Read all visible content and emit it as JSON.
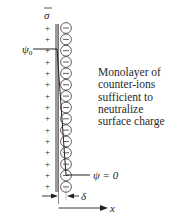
{
  "diagram": {
    "sigma_label": "σ",
    "psi0_label": "ψ",
    "psi0_subscript": "0",
    "psi_zero_label": "ψ = 0",
    "delta_label": "δ",
    "x_axis_label": "x",
    "caption_lines": [
      "Monolayer of",
      "counter-ions",
      "sufficient to",
      "neutralize",
      "surface charge"
    ],
    "surface_charge_sign": "+",
    "counter_ion_sign": "−",
    "surface_charge_count": 15,
    "counter_ion_count": 15,
    "colors": {
      "wall": "#9a9a9a",
      "line": "#222222",
      "text": "#2a2a2a"
    }
  }
}
